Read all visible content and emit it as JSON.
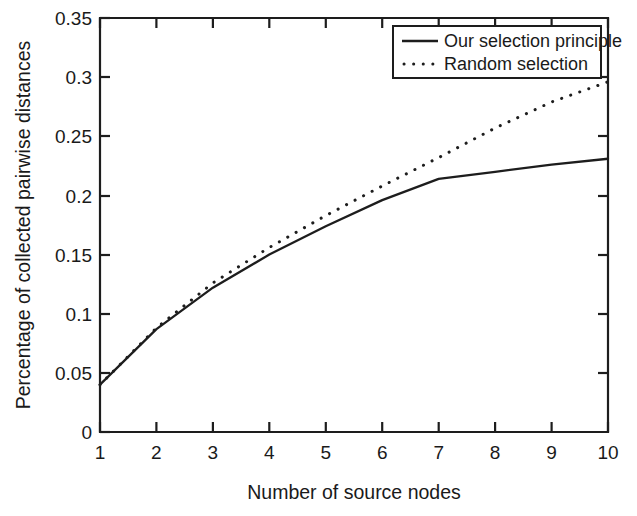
{
  "chart_data": {
    "type": "line",
    "title": "",
    "xlabel": "Number of source nodes",
    "ylabel": "Percentage of collected pairwise distances",
    "xlim": [
      1,
      10
    ],
    "ylim": [
      0,
      0.35
    ],
    "grid": false,
    "legend_position": "top-right",
    "x": [
      1,
      2,
      3,
      4,
      5,
      6,
      7,
      8,
      9,
      10
    ],
    "xticks": [
      "1",
      "2",
      "3",
      "4",
      "5",
      "6",
      "7",
      "8",
      "9",
      "10"
    ],
    "yticks": [
      "0",
      "0.05",
      "0.1",
      "0.15",
      "0.2",
      "0.25",
      "0.3",
      "0.35"
    ],
    "ytick_values": [
      0,
      0.05,
      0.1,
      0.15,
      0.2,
      0.25,
      0.3,
      0.35
    ],
    "series": [
      {
        "name": "Our selection principle",
        "style": "solid",
        "color": "#1d1d1d",
        "values": [
          0.04,
          0.087,
          0.122,
          0.15,
          0.174,
          0.196,
          0.214,
          0.22,
          0.226,
          0.231
        ]
      },
      {
        "name": "Random selection",
        "style": "dotted",
        "color": "#1d1d1d",
        "values": [
          0.04,
          0.088,
          0.126,
          0.156,
          0.183,
          0.208,
          0.232,
          0.257,
          0.279,
          0.296
        ]
      }
    ]
  },
  "legend": {
    "entries": [
      {
        "label": "Our selection principle",
        "style": "solid"
      },
      {
        "label": "Random selection",
        "style": "dotted"
      }
    ]
  },
  "axes": {
    "x_title": "Number of source nodes",
    "y_title": "Percentage of collected pairwise distances"
  }
}
